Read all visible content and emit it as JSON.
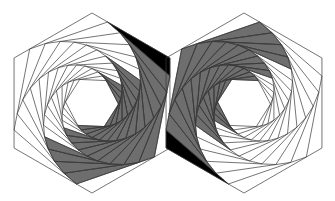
{
  "figure": {
    "title": "",
    "width": 335,
    "height": 201,
    "background": "#ffffff",
    "colors": {
      "line": "#3a3a3a",
      "band_grey": "#6e6e6e",
      "wedge_black": "#000000"
    },
    "whirl": {
      "levels": 14,
      "fraction_t": 0.2,
      "direction": "clockwise"
    },
    "hexagons": [
      {
        "name": "left-hexagon",
        "center": [
          92,
          103
        ],
        "radius": 90,
        "orientation": "pointy-top",
        "band_angle_range_deg": [
          -35,
          135
        ],
        "black_wedge_vertex_angle_deg": -30
      },
      {
        "name": "right-hexagon",
        "center": [
          244,
          103
        ],
        "radius": 90,
        "orientation": "pointy-top",
        "band_angle_range_deg": [
          145,
          315
        ],
        "black_wedge_vertex_angle_deg": 150
      }
    ]
  }
}
